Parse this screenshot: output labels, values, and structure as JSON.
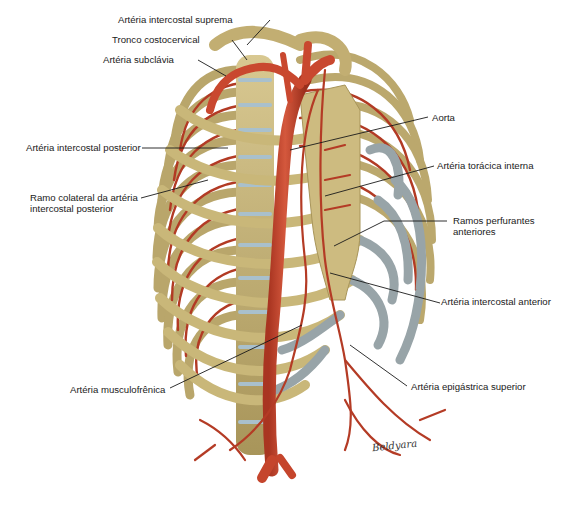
{
  "figure": {
    "signature": "Beldyara",
    "colors": {
      "bone": "#c7b57d",
      "bone_shadow": "#a08c52",
      "cartilage": "#9aa5a8",
      "artery": "#c0442c",
      "artery_dark": "#8e2a1a",
      "disc": "#a9c0cc",
      "leader_line": "#1a1a1a",
      "background": "#ffffff"
    }
  },
  "labels": [
    {
      "id": "arteria-intercostal-suprema",
      "text": "Artéria intercostal suprema",
      "x": 118,
      "y": 14
    },
    {
      "id": "tronco-costocervical",
      "text": "Tronco costocervical",
      "x": 112,
      "y": 34
    },
    {
      "id": "arteria-subclavia",
      "text": "Artéria subclávia",
      "x": 103,
      "y": 54
    },
    {
      "id": "arteria-intercostal-posterior",
      "text": "Artéria intercostal posterior",
      "x": 26,
      "y": 144
    },
    {
      "id": "ramo-colateral",
      "text": "Ramo colateral da artéria intercostal posterior",
      "x": 30,
      "y": 194
    },
    {
      "id": "aorta",
      "text": "Aorta",
      "x": 432,
      "y": 114
    },
    {
      "id": "arteria-toracica-interna",
      "text": "Artéria torácica interna",
      "x": 437,
      "y": 162
    },
    {
      "id": "ramos-perfurantes-anteriores",
      "text": "Ramos perfurantes anteriores",
      "x": 453,
      "y": 217
    },
    {
      "id": "arteria-intercostal-anterior",
      "text": "Artéria intercostal anterior",
      "x": 441,
      "y": 298
    },
    {
      "id": "arteria-musculofrenica",
      "text": "Artéria musculofrênica",
      "x": 70,
      "y": 386
    },
    {
      "id": "arteria-epigastrica-superior",
      "text": "Artéria epigástrica superior",
      "x": 411,
      "y": 383
    }
  ],
  "leaders": [
    {
      "id": "arteria-intercostal-suprema",
      "x1": 270,
      "y1": 20,
      "x2": 247,
      "y2": 45
    },
    {
      "id": "tronco-costocervical",
      "x1": 232,
      "y1": 40,
      "x2": 247,
      "y2": 60
    },
    {
      "id": "arteria-subclavia",
      "x1": 198,
      "y1": 60,
      "x2": 226,
      "y2": 76
    },
    {
      "id": "arteria-intercostal-posterior",
      "x1": 142,
      "y1": 148,
      "x2": 228,
      "y2": 148
    },
    {
      "id": "ramo-colateral",
      "x1": 141,
      "y1": 198,
      "x2": 208,
      "y2": 180
    },
    {
      "id": "aorta",
      "x1": 428,
      "y1": 117,
      "x2": 290,
      "y2": 150
    },
    {
      "id": "arteria-toracica-interna",
      "x1": 434,
      "y1": 166,
      "x2": 325,
      "y2": 196
    },
    {
      "id": "ramos-perfurantes-anteriores",
      "x1": 447,
      "y1": 221,
      "x2": 384,
      "y2": 221
    },
    {
      "id": "ramos-perfurantes-anteriores-2",
      "x1": 384,
      "y1": 221,
      "x2": 334,
      "y2": 246
    },
    {
      "id": "arteria-intercostal-anterior",
      "x1": 440,
      "y1": 303,
      "x2": 330,
      "y2": 273
    },
    {
      "id": "arteria-musculofrenica",
      "x1": 170,
      "y1": 388,
      "x2": 302,
      "y2": 325
    },
    {
      "id": "arteria-epigastrica-superior",
      "x1": 407,
      "y1": 386,
      "x2": 350,
      "y2": 345
    }
  ]
}
